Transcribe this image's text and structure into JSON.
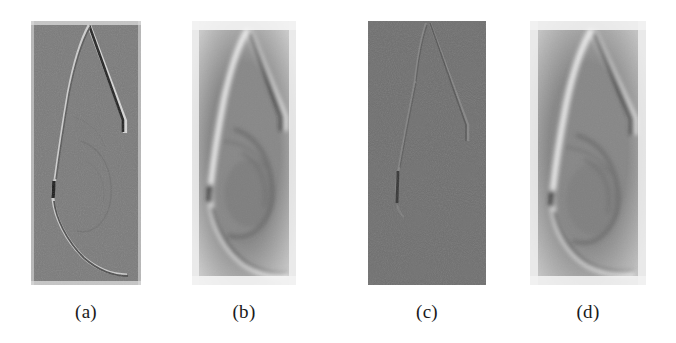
{
  "figure": {
    "kind": "figure-panel-row",
    "panel_count": 4,
    "background_color": "#ffffff",
    "panels": [
      {
        "id": "a",
        "caption": "(a)",
        "description": "edge-enhanced mammogram, sharp high-frequency gradient view",
        "x": 31,
        "y": 21,
        "width": 110,
        "height": 264,
        "caption_center_x": 86,
        "caption_y": 301,
        "base_gray": "#7b7b7b",
        "border_gray": "#e8e8e8",
        "contrast": "high-frequency",
        "noise": 0.34,
        "blur": 0.0,
        "edge_dark": "#2a2a2a",
        "edge_light": "#d8d8d8",
        "halo": 0.15
      },
      {
        "id": "b",
        "caption": "(b)",
        "description": "smoothed reconstruction with bright halo border, breast tissue visible",
        "x": 192,
        "y": 21,
        "width": 104,
        "height": 264,
        "caption_center_x": 244,
        "caption_y": 301,
        "base_gray": "#888888",
        "border_gray": "#f2f2f2",
        "contrast": "smooth",
        "noise": 0.16,
        "blur": 1.6,
        "edge_dark": "#3a3a3a",
        "edge_light": "#efefef",
        "halo": 0.85
      },
      {
        "id": "c",
        "caption": "(c)",
        "description": "very low contrast faint edge map, mostly flat gray",
        "x": 368,
        "y": 21,
        "width": 118,
        "height": 264,
        "caption_center_x": 427,
        "caption_y": 301,
        "base_gray": "#6f6f6f",
        "border_gray": "#6f6f6f",
        "contrast": "low",
        "noise": 0.3,
        "blur": 0.0,
        "edge_dark": "#4a4a4a",
        "edge_light": "#8a8a8a",
        "halo": 0.0
      },
      {
        "id": "d",
        "caption": "(d)",
        "description": "smoothed reconstruction with halo, similar to panel b",
        "x": 530,
        "y": 21,
        "width": 116,
        "height": 264,
        "caption_center_x": 588,
        "caption_y": 301,
        "base_gray": "#878787",
        "border_gray": "#f0f0f0",
        "contrast": "smooth",
        "noise": 0.18,
        "blur": 1.5,
        "edge_dark": "#3d3d3d",
        "edge_light": "#ededed",
        "halo": 0.75
      }
    ]
  }
}
